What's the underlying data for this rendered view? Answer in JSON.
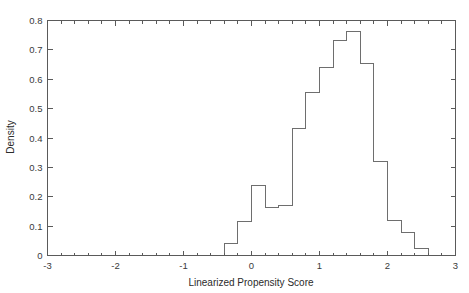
{
  "chart_data": {
    "type": "bar",
    "title": "",
    "subtitle": "",
    "xlabel": "Linearized Propensity Score",
    "ylabel": "Density",
    "xlim": [
      -3,
      3
    ],
    "ylim": [
      0,
      0.8
    ],
    "grid": false,
    "legend": null,
    "bin_width": 0.2,
    "bin_edges": [
      -0.4,
      -0.2,
      0.0,
      0.2,
      0.4,
      0.6,
      0.8,
      1.0,
      1.2,
      1.4,
      1.6,
      1.8,
      2.0,
      2.2,
      2.4,
      2.6
    ],
    "categories": [
      "-0.4 to -0.2",
      "-0.2 to 0.0",
      "0.0 to 0.2",
      "0.2 to 0.4",
      "0.4 to 0.6",
      "0.6 to 0.8",
      "0.8 to 1.0",
      "1.0 to 1.2",
      "1.2 to 1.4",
      "1.4 to 1.6",
      "1.6 to 1.8",
      "1.8 to 2.0",
      "2.0 to 2.2",
      "2.2 to 2.4",
      "2.4 to 2.6"
    ],
    "values": [
      0.042,
      0.115,
      0.238,
      0.164,
      0.172,
      0.432,
      0.554,
      0.64,
      0.733,
      0.762,
      0.654,
      0.319,
      0.118,
      0.079,
      0.023
    ],
    "x_ticks": [
      -3,
      -2,
      -1,
      0,
      1,
      2,
      3
    ],
    "x_tick_labels": [
      "-3",
      "-2",
      "-1",
      "0",
      "1",
      "2",
      "3"
    ],
    "y_ticks": [
      0,
      0.1,
      0.2,
      0.3,
      0.4,
      0.5,
      0.6,
      0.7,
      0.8
    ],
    "y_tick_labels": [
      "0",
      "0.1",
      "0.2",
      "0.3",
      "0.4",
      "0.5",
      "0.6",
      "0.7",
      "0.8"
    ],
    "colors": {
      "bar_edge": "#6e6e6e",
      "bar_fill": "none",
      "axis": "#5a5a5a",
      "text": "#2b2b2b",
      "background": "#ffffff"
    }
  }
}
